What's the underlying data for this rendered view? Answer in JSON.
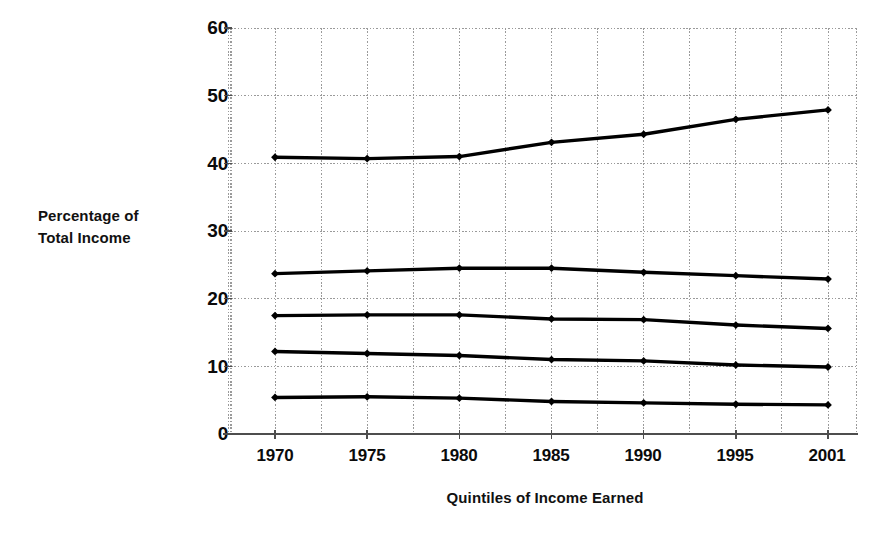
{
  "chart_data": {
    "type": "line",
    "title": "",
    "subtitle": "",
    "xlabel": "Quintiles of Income Earned",
    "ylabel": "Percentage of Total Income",
    "ylabel_lines": [
      "Percentage of",
      "Total Income"
    ],
    "categories": [
      "1970",
      "1975",
      "1980",
      "1985",
      "1990",
      "1995",
      "2001"
    ],
    "x": [
      1970,
      1975,
      1980,
      1985,
      1990,
      1995,
      2001
    ],
    "ylim": [
      0,
      60
    ],
    "yticks": [
      0,
      10,
      20,
      30,
      40,
      50,
      60
    ],
    "ytick_labels": [
      "0",
      "10",
      "20",
      "30",
      "40",
      "50",
      "60"
    ],
    "grid": true,
    "grid_style": "dotted",
    "legend": "none",
    "series": [
      {
        "name": "Highest quintile",
        "values": [
          40.9,
          40.7,
          41.0,
          43.1,
          44.3,
          46.5,
          47.9
        ],
        "color": "#000000",
        "marker": "diamond"
      },
      {
        "name": "Fourth quintile",
        "values": [
          23.7,
          24.1,
          24.5,
          24.5,
          23.9,
          23.4,
          22.9
        ],
        "color": "#000000",
        "marker": "diamond"
      },
      {
        "name": "Third quintile",
        "values": [
          17.5,
          17.6,
          17.6,
          17.0,
          16.9,
          16.1,
          15.6
        ],
        "color": "#000000",
        "marker": "diamond"
      },
      {
        "name": "Second quintile",
        "values": [
          12.2,
          11.9,
          11.6,
          11.0,
          10.8,
          10.2,
          9.9
        ],
        "color": "#000000",
        "marker": "diamond"
      },
      {
        "name": "Lowest quintile",
        "values": [
          5.4,
          5.5,
          5.3,
          4.8,
          4.6,
          4.4,
          4.3
        ],
        "color": "#000000",
        "marker": "diamond"
      }
    ]
  },
  "axes": {
    "y_title_line1": "Percentage of",
    "y_title_line2": "Total Income",
    "x_title": "Quintiles of Income Earned",
    "y_labels": [
      "60",
      "50",
      "40",
      "30",
      "20",
      "10",
      "0"
    ],
    "x_labels": [
      "1970",
      "1975",
      "1980",
      "1985",
      "1990",
      "1995",
      "2001"
    ]
  },
  "colors": {
    "line": "#000000",
    "grid": "#9a9a9a",
    "axis": "#4d4d4d",
    "background": "#ffffff",
    "text": "#000000"
  }
}
